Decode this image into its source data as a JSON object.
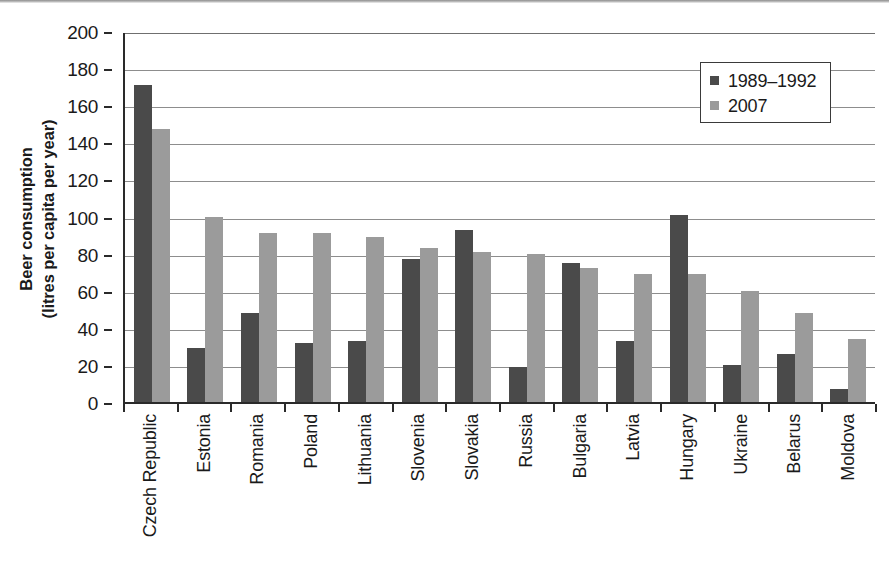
{
  "chart_data": {
    "type": "bar",
    "title": "",
    "subtitle": "",
    "xlabel": "",
    "ylabel_lines": [
      "Beer consumption",
      "(litres per capita per year)"
    ],
    "ylabel": "Beer consumption (litres per capita per year)",
    "ylim": [
      0,
      200
    ],
    "ytick_interval": 20,
    "yticks": [
      200,
      180,
      160,
      140,
      120,
      100,
      80,
      60,
      40,
      20,
      0
    ],
    "grid": "horizontal",
    "legend_position": "top-right-inside",
    "categories": [
      "Czech Republic",
      "Estonia",
      "Romania",
      "Poland",
      "Lithuania",
      "Slovenia",
      "Slovakia",
      "Russia",
      "Bulgaria",
      "Latvia",
      "Hungary",
      "Ukraine",
      "Belarus",
      "Moldova"
    ],
    "series": [
      {
        "name": "1989–1992",
        "color": "#4a4a4a",
        "values": [
          171,
          29,
          48,
          32,
          33,
          77,
          93,
          19,
          75,
          33,
          101,
          20,
          26,
          7
        ]
      },
      {
        "name": "2007",
        "color": "#9b9b9b",
        "values": [
          147,
          100,
          91,
          91,
          89,
          83,
          81,
          80,
          72,
          69,
          69,
          60,
          48,
          34
        ]
      }
    ]
  },
  "legend": {
    "entries": [
      {
        "label": "1989–1992",
        "swatch": "s1"
      },
      {
        "label": "2007",
        "swatch": "s2"
      }
    ]
  }
}
